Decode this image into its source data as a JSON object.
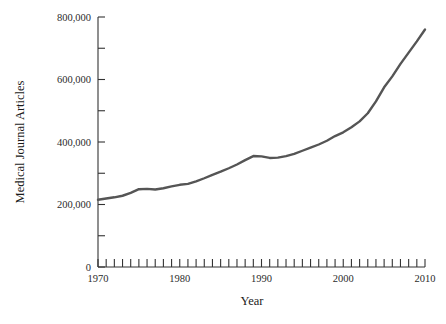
{
  "chart_data": {
    "type": "line",
    "title": "",
    "xlabel": "Year",
    "ylabel": "Medical Journal Articles",
    "xlim": [
      1970,
      2010
    ],
    "ylim": [
      0,
      800000
    ],
    "grid": false,
    "legend": null,
    "y_tick_labels": [
      "0",
      "200,000",
      "400,000",
      "600,000",
      "800,000"
    ],
    "y_tick_values": [
      0,
      200000,
      400000,
      600000,
      800000
    ],
    "y_minor_tick_values": [
      100000,
      300000,
      500000,
      700000
    ],
    "x_tick_labels": [
      "1970",
      "1980",
      "1990",
      "2000",
      "2010"
    ],
    "x_tick_values": [
      1970,
      1980,
      1990,
      2000,
      2010
    ],
    "x_minor_tick_interval": 1,
    "series": [
      {
        "name": "Medical Journal Articles",
        "color": "#555555",
        "x": [
          1970,
          1971,
          1972,
          1973,
          1974,
          1975,
          1976,
          1977,
          1978,
          1979,
          1980,
          1981,
          1982,
          1983,
          1984,
          1985,
          1986,
          1987,
          1988,
          1989,
          1990,
          1991,
          1992,
          1993,
          1994,
          1995,
          1996,
          1997,
          1998,
          1999,
          2000,
          2001,
          2002,
          2003,
          2004,
          2005,
          2006,
          2007,
          2008,
          2009,
          2010
        ],
        "values": [
          215000,
          219000,
          223000,
          228000,
          237000,
          249000,
          250000,
          248000,
          252000,
          258000,
          263000,
          266000,
          274000,
          284000,
          295000,
          305000,
          316000,
          328000,
          342000,
          355000,
          354000,
          349000,
          350000,
          355000,
          362000,
          372000,
          382000,
          392000,
          404000,
          419000,
          431000,
          447000,
          466000,
          492000,
          530000,
          575000,
          610000,
          650000,
          686000,
          722000,
          760000
        ]
      }
    ]
  },
  "axes": {
    "x_title": "Year",
    "y_title": "Medical Journal Articles"
  }
}
